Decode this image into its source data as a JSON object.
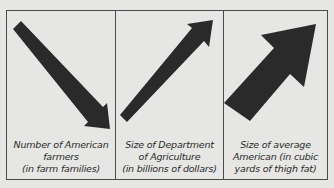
{
  "colors": {
    "background": "#e6e6e4",
    "border": "#4a4a4a",
    "arrow": "#2a2a2a",
    "text": "#2a2a2a"
  },
  "panels": [
    {
      "icon": "arrow-down-right-icon",
      "trend": "down",
      "caption_lines": [
        "Number of American",
        "farmers",
        "(in farm families)"
      ]
    },
    {
      "icon": "arrow-up-right-icon",
      "trend": "up",
      "caption_lines": [
        "Size of Department",
        "of Agriculture",
        "(in billions of dollars)"
      ]
    },
    {
      "icon": "thick-arrow-up-right-icon",
      "trend": "up-large",
      "caption_lines": [
        "Size of average",
        "American (in cubic",
        "yards of thigh fat)"
      ]
    }
  ]
}
